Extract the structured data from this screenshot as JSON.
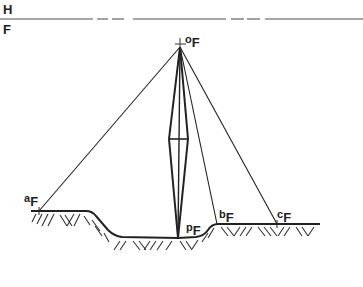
{
  "diagram": {
    "type": "perspective geometry / surveying figure",
    "horizon_labels": {
      "upper": "H",
      "lower": "F"
    },
    "points": {
      "o": {
        "letter": "o",
        "subscript": "F"
      },
      "a": {
        "letter": "a",
        "subscript": "F"
      },
      "b": {
        "letter": "b",
        "subscript": "F"
      },
      "c": {
        "letter": "c",
        "subscript": "F"
      },
      "p": {
        "letter": "p",
        "subscript": "F"
      }
    },
    "colors": {
      "ink": "#222222",
      "horizon": "#888888",
      "background": "#ffffff"
    }
  }
}
